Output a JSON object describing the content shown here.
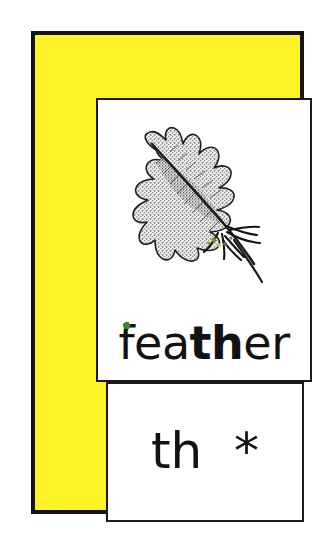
{
  "card": {
    "type": "phonics-flashcard",
    "frame_color": "#fbf324",
    "border_color": "#141414",
    "panel_background": "#ffffff",
    "text_color": "#121212"
  },
  "picture_panel": {
    "illustration_name": "feather-illustration",
    "illustration_description": "feather",
    "illustration_colors": {
      "vane_light": "#efefef",
      "vane_speckle": "#4a4a4a",
      "outline": "#1a1a1a",
      "quill": "#151515",
      "fleck_green": "#6f8f22",
      "fleck_yellow": "#c9c43a",
      "fleck_purple": "#6b5a8f"
    },
    "word": {
      "full": "feather",
      "segments": [
        {
          "text": "fea",
          "bold": false
        },
        {
          "text": "th",
          "bold": true
        },
        {
          "text": "er",
          "bold": false
        }
      ],
      "accent_fleck_color": "#2f8f1e"
    }
  },
  "grapheme_panel": {
    "grapheme": "th  *",
    "grapheme_letters": "th",
    "marker": "*"
  }
}
